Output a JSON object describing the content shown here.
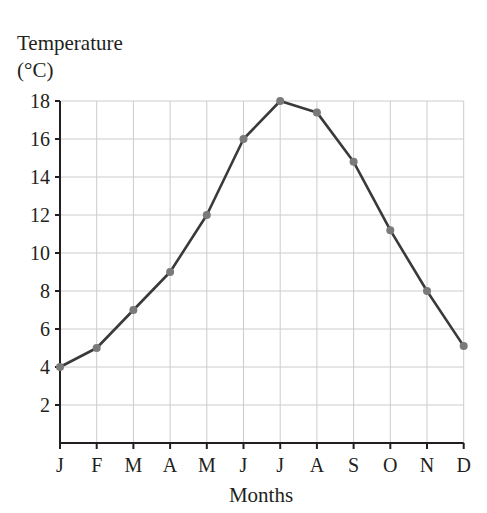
{
  "chart_data": {
    "type": "line",
    "title": "",
    "xlabel": "Months",
    "ylabel": [
      "Temperature",
      "(°C)"
    ],
    "categories": [
      "J",
      "F",
      "M",
      "A",
      "M",
      "J",
      "J",
      "A",
      "S",
      "O",
      "N",
      "D"
    ],
    "series": [
      {
        "name": "Temperature",
        "values": [
          4,
          5,
          7,
          9,
          12,
          16,
          18,
          17.4,
          14.8,
          11.2,
          8,
          5.1
        ]
      }
    ],
    "yticks": [
      2,
      4,
      6,
      8,
      10,
      12,
      14,
      16,
      18
    ],
    "ylim": [
      0,
      18
    ],
    "grid": true,
    "legend": null,
    "colors": {
      "line": "#3a3a3a",
      "marker": "#7a7a7a",
      "grid": "#cccccc",
      "axis": "#231f20"
    }
  }
}
